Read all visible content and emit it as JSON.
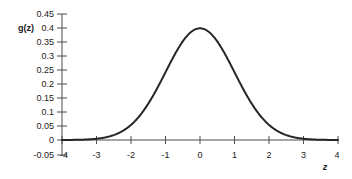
{
  "chart_data": {
    "type": "line",
    "title": "",
    "subtitle": "",
    "xlabel": "z",
    "ylabel": "g(z)",
    "xlim": [
      -4,
      4
    ],
    "ylim": [
      -0.05,
      0.45
    ],
    "grid": false,
    "legend": null,
    "function": "standard normal probability density g(z) = (1/sqrt(2*pi)) * exp(-z^2/2)",
    "xticks": [
      "-4",
      "-3",
      "-2",
      "-1",
      "0",
      "1",
      "2",
      "3",
      "4"
    ],
    "xtick_values": [
      -4,
      -3,
      -2,
      -1,
      0,
      1,
      2,
      3,
      4
    ],
    "yticks": [
      "-0.05",
      "0",
      "0.05",
      "0.1",
      "0.15",
      "0.2",
      "0.25",
      "0.3",
      "0.35",
      "0.4",
      "0.45"
    ],
    "ytick_values": [
      -0.05,
      0,
      0.05,
      0.1,
      0.15,
      0.2,
      0.25,
      0.3,
      0.35,
      0.4,
      0.45
    ],
    "series": [
      {
        "name": "g(z)",
        "color": "#262626",
        "x": [
          -4,
          -3.75,
          -3.5,
          -3.25,
          -3,
          -2.75,
          -2.5,
          -2.25,
          -2,
          -1.75,
          -1.5,
          -1.25,
          -1,
          -0.75,
          -0.5,
          -0.25,
          0,
          0.25,
          0.5,
          0.75,
          1,
          1.25,
          1.5,
          1.75,
          2,
          2.25,
          2.5,
          2.75,
          3,
          3.25,
          3.5,
          3.75,
          4
        ],
        "values": [
          0.0001,
          0.0004,
          0.0009,
          0.002,
          0.0044,
          0.0091,
          0.0175,
          0.0317,
          0.054,
          0.0863,
          0.1295,
          0.1826,
          0.242,
          0.3011,
          0.3521,
          0.3867,
          0.3989,
          0.3867,
          0.3521,
          0.3011,
          0.242,
          0.1826,
          0.1295,
          0.0863,
          0.054,
          0.0317,
          0.0175,
          0.0091,
          0.0044,
          0.002,
          0.0009,
          0.0004,
          0.0001
        ]
      }
    ],
    "peak": {
      "x": 0,
      "y": 0.3989
    },
    "colors": {
      "curve": "#262626",
      "axis": "#4d4d4d",
      "text": "#1a1a1a",
      "background": "#ffffff"
    }
  }
}
